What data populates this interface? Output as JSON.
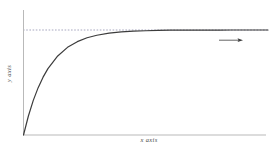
{
  "chart_data": {
    "type": "line",
    "title": "",
    "subtitle": "",
    "xlabel": "x axis",
    "ylabel": "y axis",
    "xlim": [
      0,
      10
    ],
    "ylim": [
      0,
      1.12
    ],
    "grid": false,
    "legend": null,
    "x_ticklabels": [],
    "y_ticklabels": [],
    "series": [
      {
        "name": "saturating curve",
        "color": "#3c3c3c",
        "style": "solid",
        "width": 1.2,
        "description": "monotonic rise-to-asymptote curve approaching the plateau value",
        "x": [
          0,
          0.2,
          0.4,
          0.6,
          0.8,
          1.0,
          1.4,
          1.8,
          2.2,
          2.6,
          3.0,
          3.5,
          4.0,
          4.5,
          5.0,
          5.5,
          6.0,
          6.5,
          7.0,
          7.5,
          8.0,
          8.5,
          9.0,
          9.5,
          10.0
        ],
        "y": [
          0.0,
          0.181,
          0.33,
          0.451,
          0.551,
          0.632,
          0.753,
          0.835,
          0.889,
          0.926,
          0.95,
          0.97,
          0.982,
          0.989,
          0.993,
          0.996,
          0.998,
          0.9985,
          0.999,
          0.9994,
          0.9997,
          0.9998,
          0.9999,
          0.99993,
          0.99995
        ]
      }
    ],
    "annotations": [
      {
        "name": "asymptote",
        "type": "hline",
        "y": 1.0,
        "style": "dashed",
        "color": "#6e6e96",
        "width": 0.6,
        "label": ""
      },
      {
        "name": "plateau-arrow",
        "type": "arrow",
        "direction": "right",
        "x_start": 8.2,
        "x_end": 9.6,
        "y": 0.9,
        "color": "#3c3c3c",
        "label": ""
      }
    ],
    "axes_style": {
      "spines": [
        "left",
        "bottom"
      ],
      "color": "#b9b9b9",
      "ticks": false,
      "tick_labels": false
    }
  },
  "colors": {
    "background": "#ffffff",
    "curve": "#3c3c3c",
    "axis": "#b9b9b9",
    "asymptote": "#6e6e96",
    "label_text": "#4a4a4a"
  }
}
